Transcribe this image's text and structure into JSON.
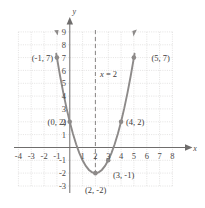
{
  "figure": {
    "axis_x_name": "x",
    "axis_y_name": "y",
    "symmetry_label_var": "x",
    "symmetry_label_rest": " = 2"
  },
  "colors": {
    "curve": "#8d8a89",
    "grid": "#c9c6c4",
    "axis": "#6f6d6c",
    "dashed": "#7a7877",
    "text": "#3d3b3a",
    "background": "#ffffff"
  },
  "chart_data": {
    "type": "line",
    "title": "",
    "xlabel": "x",
    "ylabel": "y",
    "xlim": [
      -4,
      8
    ],
    "ylim": [
      -3,
      9
    ],
    "grid": true,
    "legend": "none",
    "equation": "y = x^2 - 4x + 2",
    "vertex": [
      2,
      -2
    ],
    "axis_of_symmetry": 2,
    "axis_of_symmetry_label": "x = 2",
    "x_ticks": [
      -4,
      -3,
      -2,
      -1,
      1,
      2,
      3,
      4,
      5,
      6,
      7,
      8
    ],
    "y_ticks": [
      -3,
      -2,
      -1,
      1,
      2,
      3,
      4,
      5,
      6,
      7,
      8,
      9
    ],
    "x_tick_labels": [
      "-4",
      "-3",
      "-2",
      "-1",
      "1",
      "2",
      "3",
      "4",
      "5",
      "6",
      "7",
      "8"
    ],
    "y_tick_labels": [
      "-3",
      "-2",
      "-1",
      "1",
      "2",
      "3",
      "4",
      "5",
      "6",
      "7",
      "8",
      "9"
    ],
    "points": [
      {
        "x": -1,
        "y": 7,
        "label": "(-1, 7)",
        "label_side": "left"
      },
      {
        "x": 0,
        "y": 2,
        "label": "(0, 2)",
        "label_side": "left"
      },
      {
        "x": 2,
        "y": -2,
        "label": "(2, -2)",
        "label_side": "below"
      },
      {
        "x": 3,
        "y": -1,
        "label": "(3, -1)",
        "label_side": "right"
      },
      {
        "x": 4,
        "y": 2,
        "label": "(4, 2)",
        "label_side": "right"
      },
      {
        "x": 5,
        "y": 7,
        "label": "(5, 7)",
        "label_side": "right"
      }
    ],
    "series": [
      {
        "name": "y = x^2 - 4x + 2",
        "x": [
          -1.05,
          -0.75,
          -0.5,
          -0.25,
          0,
          0.25,
          0.5,
          0.75,
          1,
          1.25,
          1.5,
          1.75,
          2,
          2.25,
          2.5,
          2.75,
          3,
          3.25,
          3.5,
          3.75,
          4,
          4.25,
          4.5,
          4.75,
          5,
          5.05
        ],
        "values": [
          7.3,
          5.5625,
          4.25,
          3.0625,
          2,
          1.0625,
          0.25,
          -0.4375,
          -1,
          -1.4375,
          -1.75,
          -1.9375,
          -2,
          -1.9375,
          -1.75,
          -1.4375,
          -1,
          -0.4375,
          0.25,
          1.0625,
          2,
          3.0625,
          4.25,
          5.5625,
          7,
          7.3
        ]
      }
    ]
  },
  "labels": {
    "point_labels": [
      "(-1, 7)",
      "(0, 2)",
      "(2, -2)",
      "(3, -1)",
      "(4, 2)",
      "(5, 7)"
    ],
    "x_axis": "x",
    "y_axis": "y"
  }
}
